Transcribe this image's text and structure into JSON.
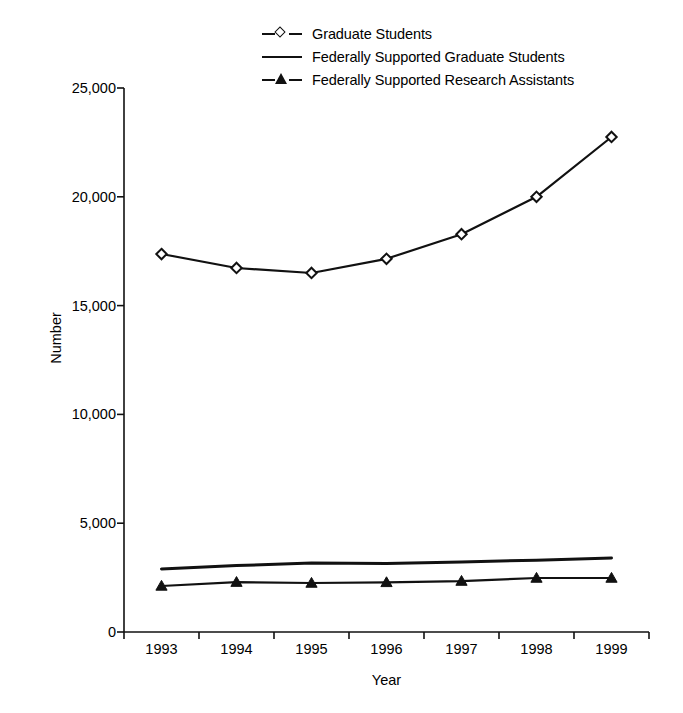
{
  "chart_data": {
    "type": "line",
    "title": "",
    "xlabel": "Year",
    "ylabel": "Number",
    "categories": [
      "1993",
      "1994",
      "1995",
      "1996",
      "1997",
      "1998",
      "1999"
    ],
    "x_tick_labels": [
      "1993",
      "1994",
      "1995",
      "1996",
      "1997",
      "1998",
      "1999"
    ],
    "y_tick_labels": [
      "0",
      "5,000",
      "10,000",
      "15,000",
      "20,000",
      "25,000"
    ],
    "y_tick_values": [
      0,
      5000,
      10000,
      15000,
      20000,
      25000
    ],
    "ylim": [
      0,
      25000
    ],
    "grid": false,
    "legend_position": "top-center",
    "series": [
      {
        "name": "Graduate Students",
        "marker": "open-diamond",
        "color": "#111111",
        "values": [
          17370,
          16730,
          16500,
          17150,
          18280,
          20000,
          22750
        ]
      },
      {
        "name": "Federally Supported Graduate Students",
        "marker": "none",
        "color": "#111111",
        "values": [
          2900,
          3050,
          3170,
          3150,
          3220,
          3300,
          3400
        ]
      },
      {
        "name": "Federally Supported Research Assistants",
        "marker": "filled-triangle",
        "color": "#111111",
        "values": [
          2115,
          2290,
          2250,
          2280,
          2340,
          2480,
          2480
        ]
      }
    ]
  },
  "legend": {
    "items": [
      {
        "label": "Graduate Students",
        "key": "line-open-diamond-icon"
      },
      {
        "label": "Federally Supported Graduate Students",
        "key": "line-plain-icon"
      },
      {
        "label": "Federally Supported Research Assistants",
        "key": "line-filled-triangle-icon"
      }
    ]
  },
  "axes": {
    "y_title": "Number",
    "x_title": "Year"
  }
}
